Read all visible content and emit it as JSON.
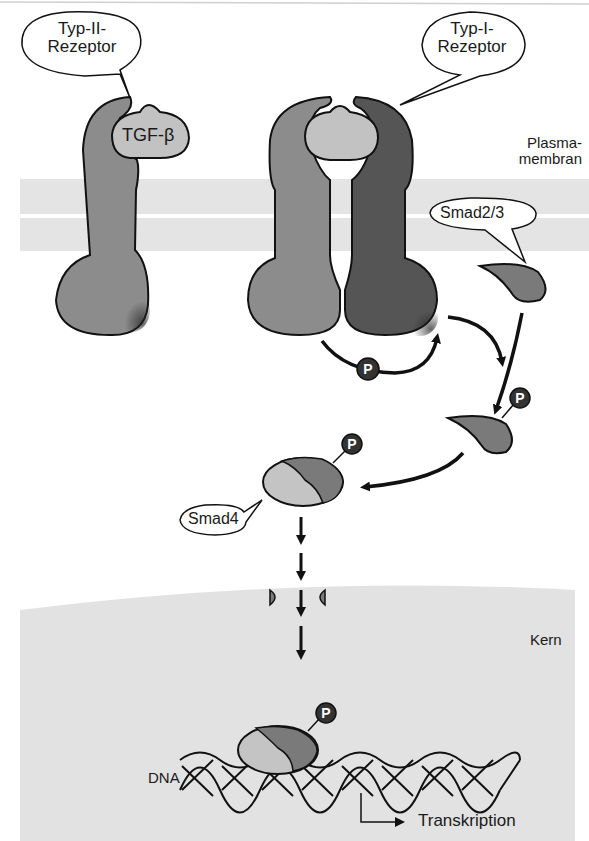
{
  "labels": {
    "type2_receptor_line1": "Typ-II-",
    "type2_receptor_line2": "Rezeptor",
    "type1_receptor_line1": "Typ-I-",
    "type1_receptor_line2": "Rezeptor",
    "ligand": "TGF-β",
    "plasma_membrane_line1": "Plasma-",
    "plasma_membrane_line2": "membran",
    "smad23": "Smad2/3",
    "smad4": "Smad4",
    "nucleus": "Kern",
    "dna": "DNA",
    "transcription": "Transkription",
    "phosphate": "P"
  },
  "colors": {
    "background": "#ffffff",
    "membrane": "#e4e4e4",
    "nucleus": "#e2e2e2",
    "receptor_type2": "#8c8c8c",
    "receptor_type1": "#555555",
    "ligand": "#c2c2c2",
    "smad23": "#7a7a7a",
    "smad4": "#c4c4c4",
    "phosphate": "#333333",
    "outline": "#111111"
  }
}
